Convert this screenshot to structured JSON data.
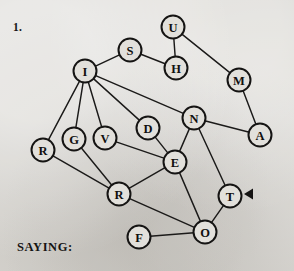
{
  "figure": {
    "number_label": "1.",
    "caption": "SAYING:",
    "background_color": "#d7d5d0",
    "ink_color": "#151413",
    "node_fill_color": "#e2e0db"
  },
  "graph": {
    "node_radius": 11.5,
    "nodes": [
      {
        "id": "U",
        "label": "U",
        "x": 173,
        "y": 27
      },
      {
        "id": "S",
        "label": "S",
        "x": 130,
        "y": 50
      },
      {
        "id": "H",
        "label": "H",
        "x": 176,
        "y": 68
      },
      {
        "id": "I",
        "label": "I",
        "x": 85,
        "y": 71
      },
      {
        "id": "M",
        "label": "M",
        "x": 239,
        "y": 80
      },
      {
        "id": "N",
        "label": "N",
        "x": 194,
        "y": 118
      },
      {
        "id": "D",
        "label": "D",
        "x": 148,
        "y": 128
      },
      {
        "id": "A",
        "label": "A",
        "x": 260,
        "y": 135
      },
      {
        "id": "V",
        "label": "V",
        "x": 105,
        "y": 138
      },
      {
        "id": "G",
        "label": "G",
        "x": 74,
        "y": 139
      },
      {
        "id": "R1",
        "label": "R",
        "x": 43,
        "y": 150
      },
      {
        "id": "E",
        "label": "E",
        "x": 175,
        "y": 162
      },
      {
        "id": "R2",
        "label": "R",
        "x": 119,
        "y": 194
      },
      {
        "id": "T",
        "label": "T",
        "x": 230,
        "y": 196
      },
      {
        "id": "O",
        "label": "O",
        "x": 205,
        "y": 232
      },
      {
        "id": "F",
        "label": "F",
        "x": 139,
        "y": 237
      }
    ],
    "edges": [
      {
        "from": "I",
        "to": "S"
      },
      {
        "from": "S",
        "to": "H"
      },
      {
        "from": "U",
        "to": "H"
      },
      {
        "from": "U",
        "to": "M"
      },
      {
        "from": "M",
        "to": "A"
      },
      {
        "from": "I",
        "to": "N"
      },
      {
        "from": "N",
        "to": "A"
      },
      {
        "from": "I",
        "to": "D"
      },
      {
        "from": "I",
        "to": "V"
      },
      {
        "from": "I",
        "to": "G"
      },
      {
        "from": "I",
        "to": "R1"
      },
      {
        "from": "D",
        "to": "E"
      },
      {
        "from": "N",
        "to": "E"
      },
      {
        "from": "N",
        "to": "T"
      },
      {
        "from": "V",
        "to": "E"
      },
      {
        "from": "G",
        "to": "R2"
      },
      {
        "from": "R1",
        "to": "R2"
      },
      {
        "from": "R2",
        "to": "E"
      },
      {
        "from": "R2",
        "to": "O"
      },
      {
        "from": "E",
        "to": "O"
      },
      {
        "from": "T",
        "to": "O"
      },
      {
        "from": "F",
        "to": "O"
      }
    ],
    "marker": {
      "name": "left-pointing-arrow",
      "x": 250,
      "y": 194,
      "points_to": "T"
    }
  }
}
